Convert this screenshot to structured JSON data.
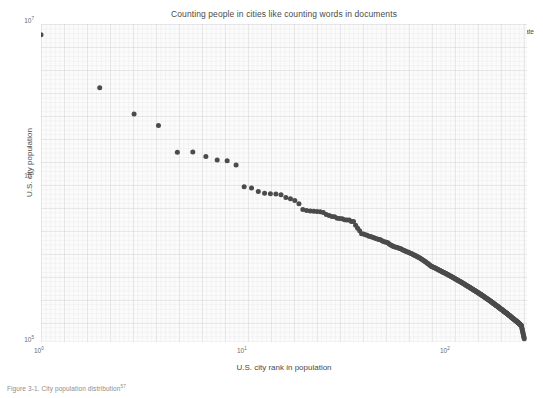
{
  "figure": {
    "caption": "Figure 3-1. City population distribution",
    "caption_footnote": "57"
  },
  "chart_data": {
    "type": "scatter",
    "title": "Counting people in cities like counting words in documents",
    "xlabel": "U.S. city rank in population",
    "ylabel": "U.S. city population",
    "xscale": "log",
    "yscale": "log",
    "xlim": [
      1,
      310
    ],
    "ylim": [
      100000,
      10000000
    ],
    "xticks": [
      "10⁰",
      "10¹",
      "10²"
    ],
    "xtick_values": [
      1,
      10,
      100
    ],
    "ytick_values": [
      100000,
      1000000,
      10000000
    ],
    "yticks": [
      "10⁵",
      "10⁶",
      "10⁷"
    ],
    "grid": true,
    "grid_style": "graph-paper",
    "legend_position": "top-right",
    "marker_color": "#4b4b4b",
    "plot_background": "#fbfbfb",
    "series": [
      {
        "name": "2015 estimate",
        "x": [
          1,
          2,
          3,
          4,
          5,
          6,
          7,
          8,
          9,
          10,
          11,
          12,
          13,
          14,
          15,
          16,
          17,
          18,
          19,
          20,
          21,
          22,
          23,
          24,
          25,
          26,
          27,
          28,
          29,
          30,
          31,
          32,
          33,
          34,
          35,
          36,
          37,
          38,
          39,
          40,
          41,
          42,
          43,
          44,
          45,
          46,
          47,
          48,
          49,
          50,
          51,
          52,
          53,
          54,
          55,
          56,
          57,
          58,
          59,
          60,
          61,
          62,
          63,
          64,
          65,
          66,
          67,
          68,
          69,
          70,
          71,
          72,
          73,
          74,
          75,
          76,
          77,
          78,
          79,
          80,
          81,
          82,
          83,
          84,
          85,
          86,
          87,
          88,
          89,
          90,
          91,
          92,
          93,
          94,
          95,
          96,
          97,
          98,
          99,
          100,
          105,
          110,
          115,
          120,
          125,
          130,
          135,
          140,
          145,
          150,
          160,
          170,
          180,
          190,
          200,
          210,
          220,
          230,
          240,
          250,
          260,
          270,
          280,
          290,
          300
        ],
        "y": [
          8550405,
          3971883,
          2720546,
          2296224,
          1563025,
          1567442,
          1469845,
          1395724,
          1381069,
          1300092,
          948279,
          928951,
          885400,
          863002,
          856252,
          853173,
          842583,
          810726,
          795695,
          776733,
          741096,
          681124,
          670820,
          667137,
          664496,
          662400,
          658780,
          653450,
          634265,
          623747,
          615366,
          613017,
          600158,
          598893,
          596814,
          588366,
          586200,
          584153,
          573011,
          572059,
          543195,
          520116,
          500952,
          478961,
          476974,
          471941,
          469045,
          462257,
          460042,
          455514,
          452022,
          447021,
          443777,
          441625,
          439041,
          432892,
          428043,
          425386,
          423364,
          421570,
          413066,
          407385,
          403892,
          398413,
          396815,
          394017,
          392890,
          389938,
          387977,
          385809,
          381300,
          377952,
          376012,
          372624,
          370011,
          367995,
          365892,
          362011,
          359844,
          357891,
          354100,
          351982,
          349011,
          346875,
          344012,
          341002,
          338491,
          335980,
          333002,
          330011,
          327014,
          324011,
          321005,
          318002,
          315011,
          312004,
          309011,
          306002,
          303011,
          300011,
          292000,
          283000,
          275000,
          268000,
          261000,
          254000,
          247000,
          241000,
          235000,
          229000,
          218000,
          208000,
          199000,
          190000,
          182000,
          174000,
          167000,
          160000,
          154000,
          148000,
          142000,
          137000,
          132000,
          127000,
          105000
        ]
      }
    ]
  }
}
